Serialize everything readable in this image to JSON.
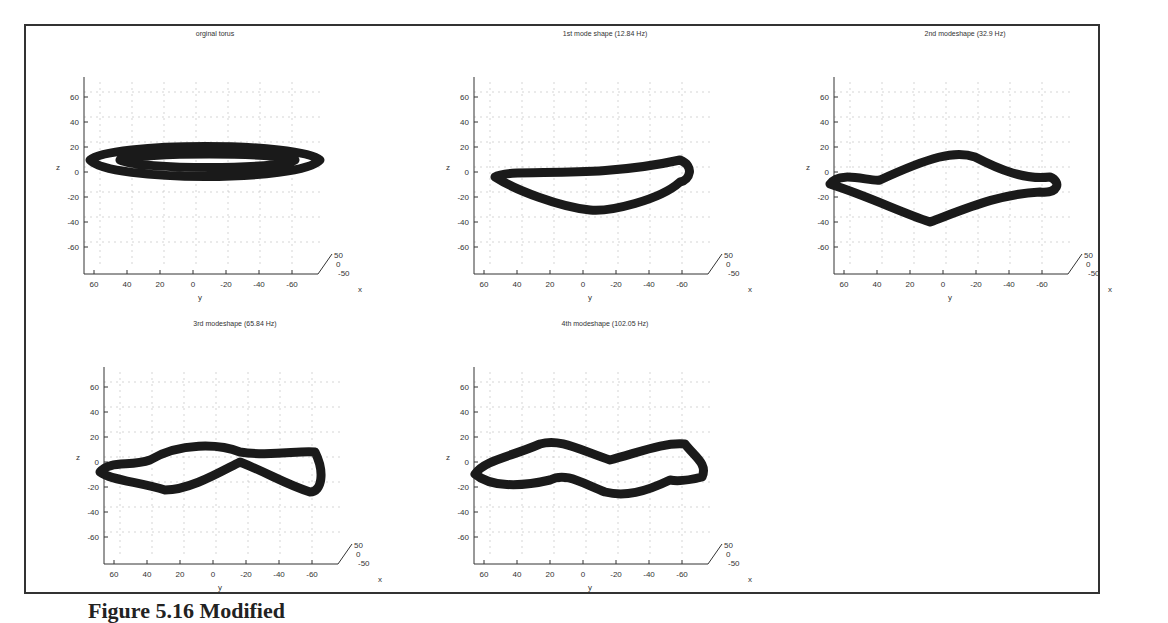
{
  "figure": {
    "caption_fragment": "Figure 5.16 Modified",
    "panels": [
      {
        "id": "p0",
        "title": "orginal torus"
      },
      {
        "id": "p1",
        "title": "1st mode shape (12.84 Hz)"
      },
      {
        "id": "p2",
        "title": "2nd modeshape (32.9 Hz)"
      },
      {
        "id": "p3",
        "title": "3rd modeshape (65.84 Hz)"
      },
      {
        "id": "p4",
        "title": "4th modeshape (102.05 Hz)"
      }
    ],
    "axes": {
      "z_ticks": [
        "60",
        "40",
        "20",
        "0",
        "-20",
        "-40",
        "-60"
      ],
      "y_ticks": [
        "60",
        "40",
        "20",
        "0",
        "-20",
        "-40",
        "-60"
      ],
      "x_ticks": [
        "50",
        "0",
        "-50"
      ],
      "z_label": "z",
      "y_label": "y",
      "x_label": "x"
    }
  },
  "chart_data": [
    {
      "type": "scatter",
      "title": "orginal torus",
      "xlabel": "y",
      "ylabel": "z",
      "zlabel": "x",
      "ylim": [
        -70,
        70
      ],
      "shape": "flat elliptical ring centered near z=10"
    },
    {
      "type": "scatter",
      "title": "1st mode shape (12.84 Hz)",
      "xlabel": "y",
      "ylabel": "z",
      "zlabel": "x",
      "ylim": [
        -70,
        70
      ],
      "shape": "bent ring, z range approx -10 to 25"
    },
    {
      "type": "scatter",
      "title": "2nd modeshape (32.9 Hz)",
      "xlabel": "y",
      "ylabel": "z",
      "zlabel": "x",
      "ylim": [
        -70,
        70
      ],
      "shape": "diamond-shaped ring, z range approx -12 to 30"
    },
    {
      "type": "scatter",
      "title": "3rd modeshape (65.84 Hz)",
      "xlabel": "y",
      "ylabel": "z",
      "zlabel": "x",
      "ylim": [
        -70,
        70
      ],
      "shape": "twisted figure-eight ring, z range approx -8 to 28"
    },
    {
      "type": "scatter",
      "title": "4th modeshape (102.05 Hz)",
      "xlabel": "y",
      "ylabel": "z",
      "zlabel": "x",
      "ylim": [
        -70,
        70
      ],
      "shape": "double-wave twisted ring, z range approx -5 to 30"
    }
  ]
}
